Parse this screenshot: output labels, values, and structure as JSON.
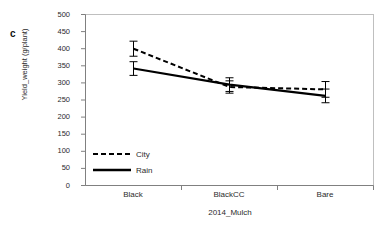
{
  "figure": {
    "panel_label": "c",
    "background": "#ffffff",
    "line_color": "#000000",
    "border_color": "#bfbfbf",
    "axis_color": "#808080"
  },
  "chart_data": {
    "type": "line",
    "title": "",
    "xlabel": "2014_Mulch",
    "ylabel": "Yield_weight (g/plant)",
    "categories": [
      "Black",
      "BlackCC",
      "Bare"
    ],
    "ylim": [
      0,
      500
    ],
    "ytick_step": 50,
    "yticks": [
      0,
      50,
      100,
      150,
      200,
      250,
      300,
      350,
      400,
      450,
      500
    ],
    "ytick_labels": [
      "0",
      "50",
      "100",
      "150",
      "200",
      "250",
      "300",
      "350",
      "400",
      "450",
      "500"
    ],
    "grid": false,
    "legend_position": "inside-lower-left",
    "series": [
      {
        "name": "City",
        "style": "dashed",
        "color": "#000000",
        "values": [
          400,
          288,
          281
        ],
        "errors": [
          22,
          18,
          23
        ]
      },
      {
        "name": "Rain",
        "style": "solid",
        "color": "#000000",
        "values": [
          342,
          295,
          262
        ],
        "errors": [
          20,
          20,
          20
        ]
      }
    ]
  }
}
